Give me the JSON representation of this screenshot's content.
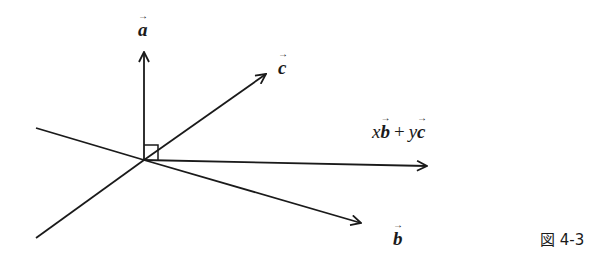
{
  "diagram": {
    "caption": "図 4-3",
    "labels": {
      "a": "a",
      "b": "b",
      "c": "c",
      "combo_x": "x",
      "combo_b": "b",
      "combo_plus": "+",
      "combo_y": "y",
      "combo_c": "c"
    },
    "colors": {
      "stroke": "#1a1a1a",
      "background": "#ffffff"
    },
    "origin": [
      144,
      160
    ],
    "vectors": [
      {
        "name": "a",
        "tip": [
          144,
          50
        ]
      },
      {
        "name": "c",
        "tip": [
          267,
          73
        ]
      },
      {
        "name": "xb+yc",
        "tip": [
          428,
          166
        ]
      },
      {
        "name": "b",
        "tip": [
          362,
          223
        ]
      }
    ],
    "lines": [
      {
        "name": "plane-line-1",
        "from": [
          36,
          128
        ],
        "to": [
          144,
          160
        ]
      },
      {
        "name": "plane-line-2",
        "from": [
          36,
          238
        ],
        "to": [
          144,
          160
        ]
      }
    ],
    "right_angle_marker": {
      "at": [
        144,
        160
      ],
      "size": 14
    }
  }
}
